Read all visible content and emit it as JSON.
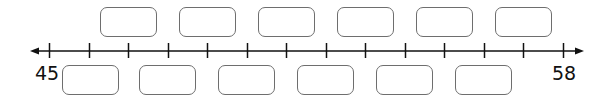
{
  "number_line": {
    "start_label": "45",
    "end_label": "58",
    "min": 45,
    "max": 58,
    "tick_count": 14,
    "tick_x_start": 49,
    "tick_spacing": 39.54,
    "line_y": 51,
    "line_x_start": 30,
    "line_x_end": 584,
    "color": "#111111"
  },
  "top_boxes": [
    {
      "x": 100,
      "y": 7,
      "value": ""
    },
    {
      "x": 179,
      "y": 7,
      "value": ""
    },
    {
      "x": 258,
      "y": 7,
      "value": ""
    },
    {
      "x": 337,
      "y": 7,
      "value": ""
    },
    {
      "x": 416,
      "y": 7,
      "value": ""
    },
    {
      "x": 495,
      "y": 7,
      "value": ""
    }
  ],
  "bottom_boxes": [
    {
      "x": 62,
      "y": 65,
      "value": ""
    },
    {
      "x": 139,
      "y": 65,
      "value": ""
    },
    {
      "x": 218,
      "y": 65,
      "value": ""
    },
    {
      "x": 297,
      "y": 65,
      "value": ""
    },
    {
      "x": 376,
      "y": 65,
      "value": ""
    },
    {
      "x": 455,
      "y": 65,
      "value": ""
    }
  ]
}
